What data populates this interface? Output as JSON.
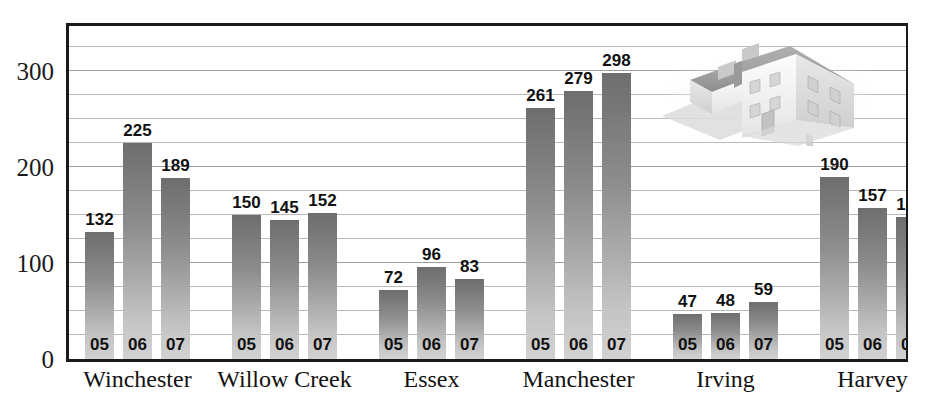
{
  "chart_data": {
    "type": "bar",
    "title": "",
    "xlabel": "",
    "ylabel": "",
    "ylim": [
      0,
      350
    ],
    "grid": true,
    "grid_step": 25,
    "legend": "none",
    "series_labels": [
      "05",
      "06",
      "07"
    ],
    "categories": [
      "Winchester",
      "Willow Creek",
      "Essex",
      "Manchester",
      "Irving",
      "Harvey"
    ],
    "series": [
      {
        "name": "05",
        "values": [
          132,
          150,
          72,
          261,
          47,
          190
        ]
      },
      {
        "name": "06",
        "values": [
          225,
          145,
          96,
          279,
          48,
          157
        ]
      },
      {
        "name": "07",
        "values": [
          189,
          152,
          83,
          298,
          59,
          148
        ]
      }
    ],
    "groups": [
      {
        "category": "Winchester",
        "bars": [
          {
            "year": "05",
            "value": 132
          },
          {
            "year": "06",
            "value": 225
          },
          {
            "year": "07",
            "value": 189
          }
        ]
      },
      {
        "category": "Willow Creek",
        "bars": [
          {
            "year": "05",
            "value": 150
          },
          {
            "year": "06",
            "value": 145
          },
          {
            "year": "07",
            "value": 152
          }
        ]
      },
      {
        "category": "Essex",
        "bars": [
          {
            "year": "05",
            "value": 72
          },
          {
            "year": "06",
            "value": 96
          },
          {
            "year": "07",
            "value": 83
          }
        ]
      },
      {
        "category": "Manchester",
        "bars": [
          {
            "year": "05",
            "value": 261
          },
          {
            "year": "06",
            "value": 279
          },
          {
            "year": "07",
            "value": 298
          }
        ]
      },
      {
        "category": "Irving",
        "bars": [
          {
            "year": "05",
            "value": 47
          },
          {
            "year": "06",
            "value": 48
          },
          {
            "year": "07",
            "value": 59
          }
        ]
      },
      {
        "category": "Harvey",
        "bars": [
          {
            "year": "05",
            "value": 190
          },
          {
            "year": "06",
            "value": 157
          },
          {
            "year": "07",
            "value": 148
          }
        ]
      }
    ],
    "yticks": [
      0,
      100,
      200,
      300
    ],
    "ytick_labels": [
      "0",
      "100",
      "200",
      "300"
    ]
  },
  "decoration": {
    "illustration": "house-illustration",
    "illustration_label": "two-story house with attached garage"
  },
  "colors": {
    "bar_top": "#6e6e6e",
    "bar_bottom": "#d2d2d2",
    "axis": "#1a1a1a",
    "gridline": "#b9b9b9",
    "text": "#111111",
    "background": "#ffffff"
  }
}
